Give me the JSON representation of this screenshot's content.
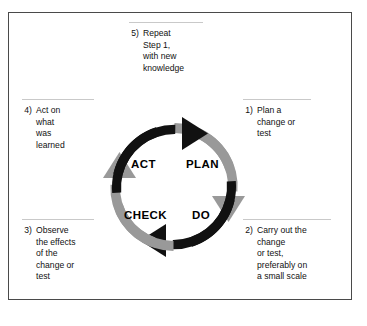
{
  "figure": {
    "colors": {
      "arrow_dark": "#111111",
      "arrow_gray": "#999999",
      "frame_border": "#4a4a4a",
      "rule": "#c9c9c9",
      "background": "#ffffff",
      "text": "#111111"
    }
  },
  "cycle": {
    "quadrants": [
      {
        "label": "PLAN",
        "color": "#999999",
        "position": "top-right"
      },
      {
        "label": "DO",
        "color": "#111111",
        "position": "bottom-right"
      },
      {
        "label": "CHECK",
        "color": "#999999",
        "position": "bottom-left"
      },
      {
        "label": "ACT",
        "color": "#111111",
        "position": "top-left"
      }
    ],
    "direction": "clockwise"
  },
  "notes": {
    "step5": {
      "number": "5)",
      "text": "Repeat\nStep 1,\nwith new\nknowledge"
    },
    "step1": {
      "number": "1)",
      "text": "Plan a\nchange or\ntest"
    },
    "step2": {
      "number": "2)",
      "text": "Carry out the\nchange\nor test,\npreferably on\na small scale"
    },
    "step3": {
      "number": "3)",
      "text": "Observe\nthe effects\nof the\nchange or\ntest"
    },
    "step4": {
      "number": "4)",
      "text": "Act on\nwhat\nwas\nlearned"
    }
  }
}
